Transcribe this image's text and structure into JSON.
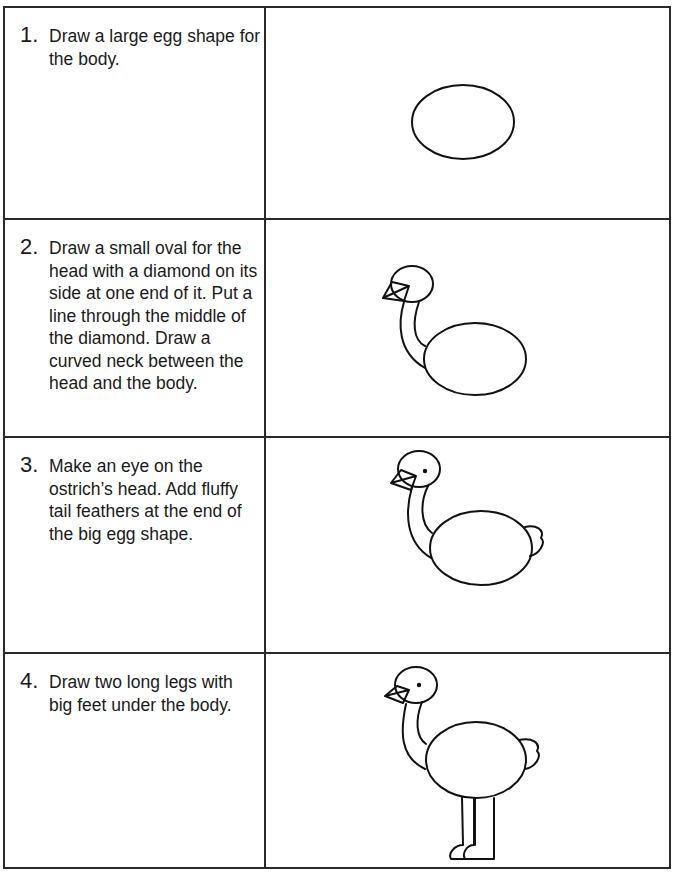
{
  "worksheet": {
    "steps": [
      {
        "number": "1.",
        "text": "Draw a large egg shape for the body.",
        "drawing": "egg-body"
      },
      {
        "number": "2.",
        "text": "Draw a small oval for the head with a diamond on its side at one end of it. Put a line through the middle of the diamond. Draw a curved neck between the head and the body.",
        "drawing": "head-neck-body"
      },
      {
        "number": "3.",
        "text": "Make an eye on the ostrich’s head. Add fluffy tail feathers at the end of the big egg shape.",
        "drawing": "eye-tail"
      },
      {
        "number": "4.",
        "text": "Draw two long legs with big feet under the body.",
        "drawing": "legs-feet"
      }
    ]
  }
}
